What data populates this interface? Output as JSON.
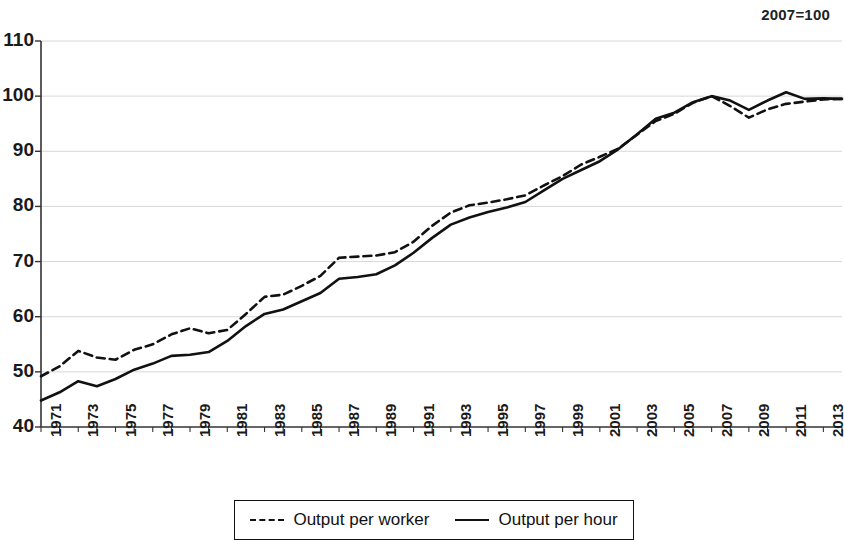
{
  "annotation": {
    "index_note": "2007=100"
  },
  "legend": {
    "position": "bottom-center",
    "entries": [
      {
        "label": "Output per worker",
        "style": "dashed",
        "icon": "dashed-line-icon"
      },
      {
        "label": "Output per hour",
        "style": "solid",
        "icon": "solid-line-icon"
      }
    ]
  },
  "chart_data": {
    "type": "line",
    "title": "",
    "subtitle": "",
    "annotation": "2007=100",
    "xlabel": "",
    "ylabel": "",
    "xlim": [
      1971,
      2014
    ],
    "ylim": [
      40,
      110
    ],
    "ytick_interval": 10,
    "yticks": [
      40,
      50,
      60,
      70,
      80,
      90,
      100,
      110
    ],
    "ytick_labels": [
      "40",
      "50",
      "60",
      "70",
      "80",
      "90",
      "100",
      "110"
    ],
    "x": [
      1971,
      1972,
      1973,
      1974,
      1975,
      1976,
      1977,
      1978,
      1979,
      1980,
      1981,
      1982,
      1983,
      1984,
      1985,
      1986,
      1987,
      1988,
      1989,
      1990,
      1991,
      1992,
      1993,
      1994,
      1995,
      1996,
      1997,
      1998,
      1999,
      2000,
      2001,
      2002,
      2003,
      2004,
      2005,
      2006,
      2007,
      2008,
      2009,
      2010,
      2011,
      2012,
      2013,
      2014
    ],
    "xtick_labels": [
      "1971",
      "1973",
      "1975",
      "1977",
      "1979",
      "1981",
      "1983",
      "1985",
      "1987",
      "1989",
      "1991",
      "1993",
      "1995",
      "1997",
      "1999",
      "2001",
      "2003",
      "2005",
      "2007",
      "2009",
      "2011",
      "2013"
    ],
    "xtick_values": [
      1971,
      1973,
      1975,
      1977,
      1979,
      1981,
      1983,
      1985,
      1987,
      1989,
      1991,
      1993,
      1995,
      1997,
      1999,
      2001,
      2003,
      2005,
      2007,
      2009,
      2011,
      2013
    ],
    "xtick_rotation": -90,
    "grid": "horizontal",
    "legend_position": "bottom-center",
    "series": [
      {
        "name": "Output per worker",
        "style": "dashed",
        "color": "#111111",
        "values": [
          49.2,
          51.0,
          53.8,
          52.6,
          52.2,
          54.0,
          55.0,
          56.8,
          57.9,
          57.0,
          57.6,
          60.5,
          63.6,
          64.0,
          65.6,
          67.4,
          70.7,
          70.9,
          71.1,
          71.7,
          73.6,
          76.5,
          78.9,
          80.2,
          80.7,
          81.3,
          82.0,
          83.8,
          85.5,
          87.6,
          89.0,
          90.5,
          93.0,
          95.5,
          96.8,
          98.8,
          100.0,
          98.2,
          96.1,
          97.6,
          98.6,
          99.0,
          99.4,
          99.5
        ]
      },
      {
        "name": "Output per hour",
        "style": "solid",
        "color": "#111111",
        "values": [
          44.8,
          46.3,
          48.3,
          47.4,
          48.7,
          50.4,
          51.5,
          52.9,
          53.1,
          53.6,
          55.6,
          58.3,
          60.5,
          61.3,
          62.8,
          64.3,
          66.9,
          67.2,
          67.7,
          69.3,
          71.6,
          74.3,
          76.7,
          78.0,
          79.0,
          79.8,
          80.8,
          82.9,
          85.0,
          86.6,
          88.2,
          90.4,
          93.1,
          95.9,
          97.0,
          98.9,
          100.0,
          99.2,
          97.5,
          99.2,
          100.7,
          99.5,
          99.6,
          99.5
        ]
      }
    ]
  }
}
